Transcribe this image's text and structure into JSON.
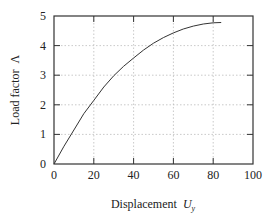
{
  "chart_data": {
    "type": "line",
    "title": "",
    "xlabel": "Displacement",
    "xlabel_symbol": "U",
    "xlabel_subscript": "y",
    "ylabel": "Load factor",
    "ylabel_symbol": "Λ",
    "xlim": [
      0,
      100
    ],
    "ylim": [
      0,
      5
    ],
    "xticks": [
      0,
      20,
      40,
      60,
      80,
      100
    ],
    "yticks": [
      0,
      1,
      2,
      3,
      4,
      5
    ],
    "grid": true,
    "legend": null,
    "series": [
      {
        "name": "load-displacement",
        "x": [
          0,
          5,
          10,
          15,
          20,
          25,
          30,
          35,
          40,
          45,
          50,
          55,
          60,
          65,
          70,
          75,
          80,
          84
        ],
        "y": [
          0,
          0.6,
          1.15,
          1.7,
          2.15,
          2.6,
          2.98,
          3.3,
          3.58,
          3.85,
          4.08,
          4.27,
          4.43,
          4.56,
          4.66,
          4.73,
          4.77,
          4.78
        ]
      }
    ],
    "colors": {
      "line": "#333333",
      "grid": "#bbbbbb",
      "axis": "#333333"
    }
  }
}
